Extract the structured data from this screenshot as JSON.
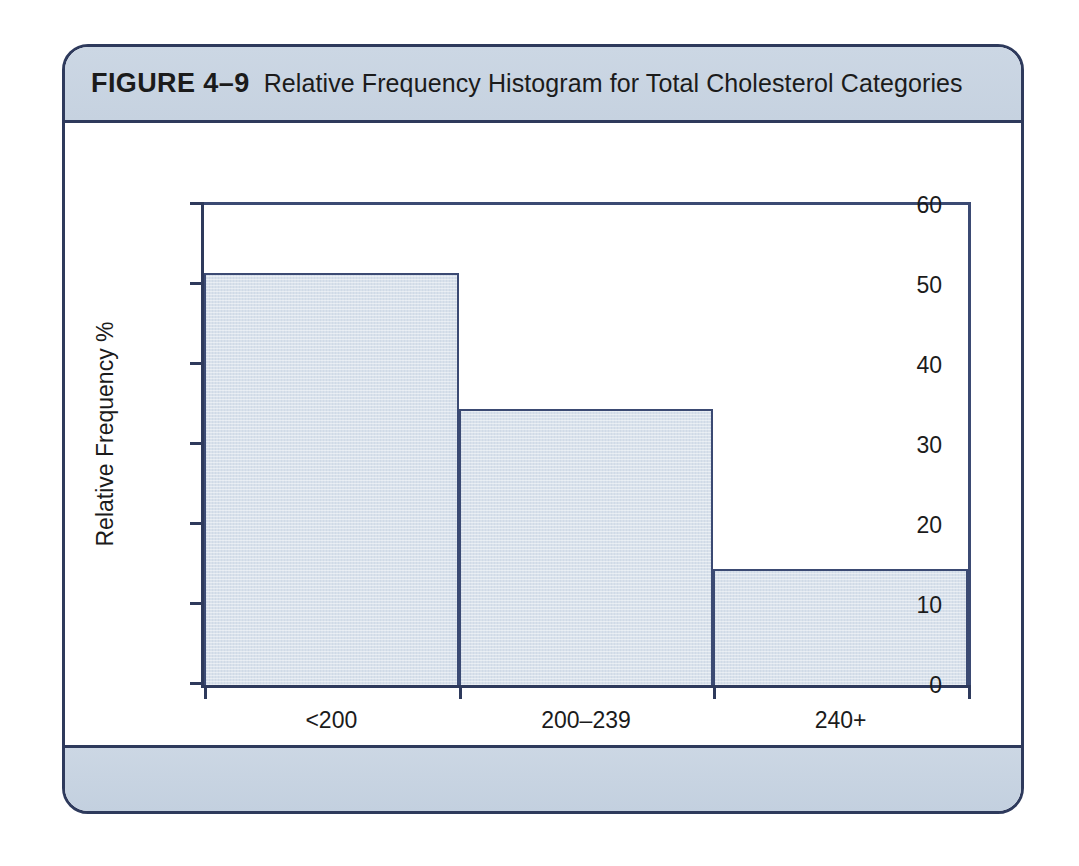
{
  "figure": {
    "label": "FIGURE 4–9",
    "caption": "Relative Frequency Histogram for Total Cholesterol Categories"
  },
  "colors": {
    "card_border": "#2e3a5c",
    "header_band": "#ccd7e4",
    "footer_band": "#ccd7e4",
    "bar_fill": "#d9e1eb",
    "bar_border": "#3b4a73",
    "axis": "#2e3a5c",
    "text": "#1b1b1b",
    "plot_background": "#ffffff"
  },
  "chart_data": {
    "type": "bar",
    "title": "Relative Frequency Histogram for Total Cholesterol Categories",
    "categories": [
      "<200",
      "200–239",
      "240+"
    ],
    "values": [
      51.5,
      34.5,
      14.5
    ],
    "xlabel": "Total Cholesterol",
    "ylabel": "Relative Frequency %",
    "ylim": [
      0,
      60
    ],
    "yticks": [
      0,
      10,
      20,
      30,
      40,
      50,
      60
    ],
    "ytick_labels": [
      "0",
      "10",
      "20",
      "30",
      "40",
      "50",
      "60"
    ],
    "grid": false,
    "legend": null,
    "bar_gap": 0,
    "bar_widths_pct": [
      33.3,
      33.3,
      33.4
    ]
  }
}
